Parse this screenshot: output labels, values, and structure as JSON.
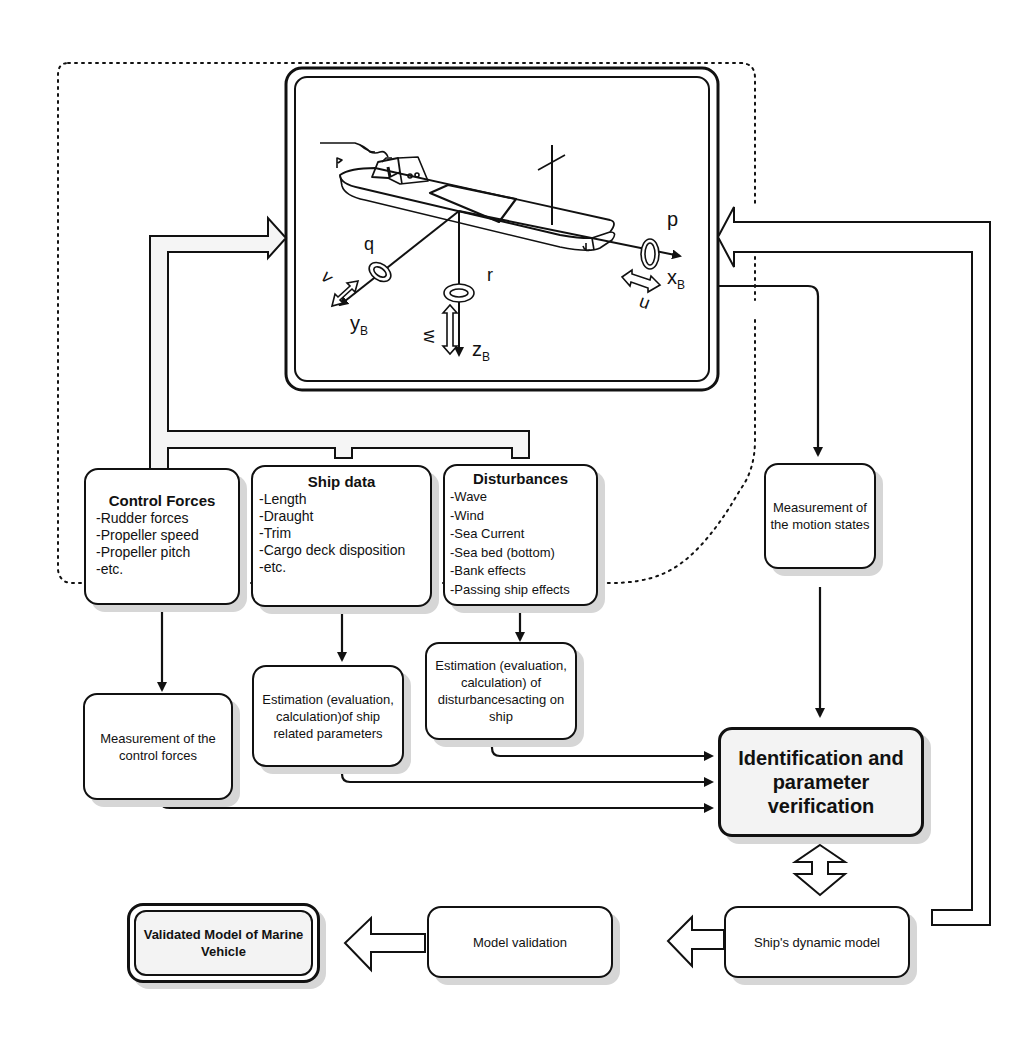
{
  "ship_panel": {
    "axis_labels": {
      "x": "x",
      "x_sub": "B",
      "y": "y",
      "y_sub": "B",
      "z": "z",
      "z_sub": "B"
    },
    "motion_labels": {
      "p": "p",
      "q": "q",
      "r": "r",
      "u": "u",
      "v": "v",
      "w": "w"
    }
  },
  "boxes": {
    "control_forces": {
      "title": "Control  Forces",
      "items": [
        "Rudder forces",
        "Propeller speed",
        "Propeller pitch",
        "etc."
      ]
    },
    "ship_data": {
      "title": "Ship  data",
      "items": [
        "Length",
        "Draught",
        "Trim",
        "Cargo deck disposition",
        "etc."
      ]
    },
    "disturbances": {
      "title": "Disturbances",
      "items": [
        "Wave",
        "Wind",
        "Sea Current",
        "Sea bed (bottom)",
        "Bank effects",
        "Passing ship effects"
      ]
    },
    "measurement_motion": {
      "text": "Measurement of the motion states"
    },
    "measurement_control": {
      "text": "Measurement of the control forces"
    },
    "estimation_ship": {
      "text": "Estimation (evaluation, calculation)of ship related parameters"
    },
    "estimation_disturbances": {
      "text": "Estimation (evaluation, calculation) of disturbancesacting on ship"
    },
    "identification": {
      "text": "Identification and parameter verification"
    },
    "dynamic_model": {
      "text": "Ship's dynamic model"
    },
    "model_validation": {
      "text": "Model validation"
    },
    "validated_model": {
      "text": "Validated Model of Marine Vehicle"
    }
  },
  "colors": {
    "stroke": "#111111",
    "shadow": "#d6d6d6",
    "fill_gray": "#f3f3f3",
    "arrow_fill": "#f5f5f5"
  }
}
